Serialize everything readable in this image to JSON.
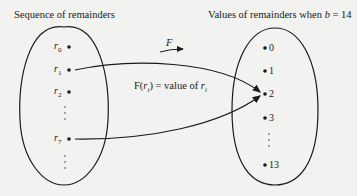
{
  "left_title": "Sequence of remainders",
  "right_title_prefix": "Values of remainders when ",
  "right_title_var": "b",
  "right_title_suffix": " = 14",
  "function_label": "F",
  "mapping_label_prefix": "F(",
  "mapping_label_var": "r",
  "mapping_label_sub": "i",
  "mapping_label_mid": ") = value of ",
  "mapping_label_var2": "r",
  "mapping_label_sub2": "i",
  "left_items": [
    {
      "var": "r",
      "sub": "0"
    },
    {
      "var": "r",
      "sub": "1"
    },
    {
      "var": "r",
      "sub": "2"
    },
    {
      "var": "r",
      "sub": "7"
    }
  ],
  "right_items": [
    "0",
    "1",
    "2",
    "3",
    "13"
  ]
}
